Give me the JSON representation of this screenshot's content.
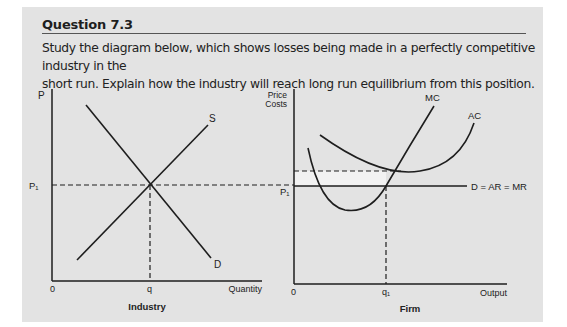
{
  "question": {
    "title": "Question 7.3",
    "text_line1": "Study the diagram below, which shows losses being made in a perfectly competitive industry in the",
    "text_line2": "short run. Explain how the industry will reach long run equilibrium from this position."
  },
  "industry_graph": {
    "y_axis_label": "P",
    "x_axis_label": "Quantity",
    "origin_label": "0",
    "price_label": "P₁",
    "quantity_label": "q",
    "supply_label": "S",
    "demand_label": "D",
    "caption": "Industry"
  },
  "firm_graph": {
    "y_axis_label_line1": "Price",
    "y_axis_label_line2": "Costs",
    "x_axis_label": "Output",
    "origin_label": "0",
    "price_label": "P₁",
    "quantity_label": "q₁",
    "mc_label": "MC",
    "ac_label": "AC",
    "demand_label": "D = AR = MR",
    "caption": "Firm",
    "loss_area_color": "#f2f2f2"
  },
  "colors": {
    "panel_background": "#e3e3e3",
    "line": "#1e1e1e"
  }
}
